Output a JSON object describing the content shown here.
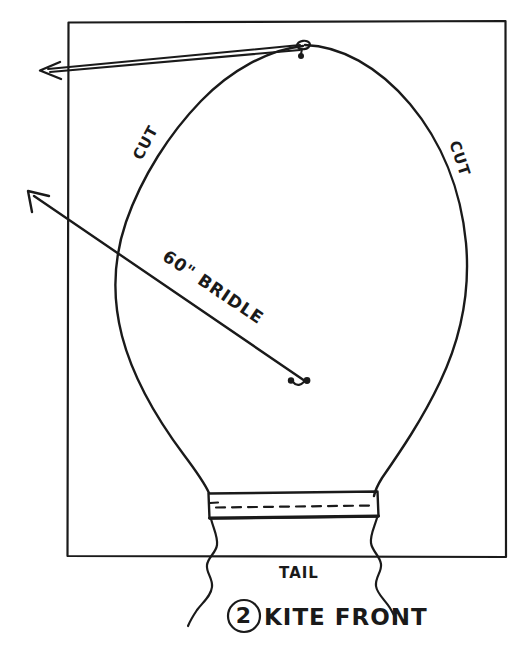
{
  "diagram": {
    "title": "KITE FRONT",
    "step_number": "2",
    "caption_full": "2 KITE FRONT",
    "background_color": "#ffffff",
    "ink_color": "#1a1a1a",
    "labels": {
      "cut_left": "CUT",
      "cut_right": "CUT",
      "bridle": "60\" BRIDLE",
      "tail": "TAIL"
    },
    "parts": {
      "fabric_rectangle": "fabric-rectangle",
      "kite_outline": "kite-outline",
      "hem_band": "hem-band",
      "stitch_line": "stitch-line",
      "tail_left_edge": "tail-left-edge",
      "tail_right_edge": "tail-right-edge",
      "bridle_line_upper": "bridle-line-upper",
      "bridle_line_lower": "bridle-line-lower",
      "bridle_knot_top": "bridle-knot-top",
      "bridle_knot_bottom": "bridle-knot-bottom",
      "arrow_upper": "arrow-upper",
      "arrow_lower": "arrow-lower"
    }
  }
}
